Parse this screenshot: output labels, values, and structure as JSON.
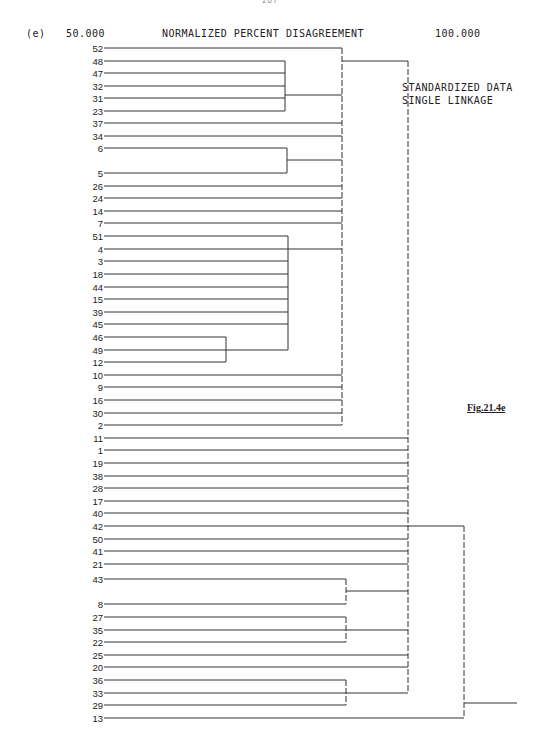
{
  "header": {
    "page_number": "267",
    "panel_label": "(e)",
    "axis_min": "50.000",
    "axis_title": "NORMALIZED PERCENT DISAGREEMENT",
    "axis_max": "100.000"
  },
  "annotations": {
    "line1": "STANDARDIZED DATA",
    "line2": "SINGLE LINKAGE",
    "figure_caption": "Fig.21.4e"
  },
  "chart_data": {
    "type": "dendrogram",
    "title": "NORMALIZED PERCENT DISAGREEMENT",
    "xlabel": "Normalized percent disagreement",
    "x_range": [
      50.0,
      100.0
    ],
    "method": "Single linkage, standardized data",
    "leaf_order": [
      52,
      48,
      47,
      32,
      31,
      23,
      37,
      34,
      6,
      5,
      26,
      24,
      14,
      7,
      51,
      4,
      3,
      18,
      44,
      15,
      39,
      45,
      46,
      49,
      12,
      10,
      9,
      16,
      30,
      2,
      11,
      1,
      19,
      38,
      28,
      17,
      40,
      42,
      50,
      41,
      21,
      43,
      8,
      27,
      35,
      22,
      25,
      20,
      36,
      33,
      29,
      13
    ],
    "leaf_y": {
      "52": 48,
      "48": 61,
      "47": 73,
      "32": 86,
      "31": 98,
      "23": 111,
      "37": 123,
      "34": 136,
      "6": 148,
      "5": 173,
      "26": 186,
      "24": 198,
      "14": 211,
      "7": 223,
      "51": 236,
      "4": 249,
      "3": 261,
      "18": 274,
      "44": 287,
      "15": 299,
      "39": 312,
      "45": 324,
      "46": 337,
      "49": 350,
      "12": 362,
      "10": 375,
      "9": 387,
      "16": 400,
      "30": 413,
      "2": 425,
      "11": 438,
      "1": 450,
      "19": 463,
      "38": 476,
      "28": 488,
      "17": 501,
      "40": 513,
      "42": 526,
      "50": 539,
      "41": 551,
      "21": 564,
      "43": 579,
      "8": 604,
      "27": 617,
      "35": 630,
      "22": 642,
      "25": 655,
      "20": 667,
      "36": 680,
      "33": 693,
      "29": 705,
      "13": 718
    },
    "leaf_x": 104,
    "merges": [
      {
        "members": [
          48,
          47,
          32,
          31,
          23
        ],
        "x": 285,
        "connect_y": 95,
        "approx_level": 85.5
      },
      {
        "members": [
          6,
          5
        ],
        "x": 287,
        "connect_y": 160,
        "approx_level": 85.7
      },
      {
        "members": [
          46,
          49,
          12
        ],
        "x": 226,
        "connect_y": 350,
        "approx_level": 80.5
      },
      {
        "members": [
          51,
          4,
          3,
          18,
          44,
          15,
          39,
          45,
          "46-49-12"
        ],
        "x": 288,
        "connect_y": 249,
        "approx_level": 85.8
      },
      {
        "members": [
          52,
          "48-23",
          37,
          34,
          "6-5",
          26,
          24,
          14,
          7,
          "51-12",
          10,
          9,
          16,
          30,
          2
        ],
        "x": 342,
        "connect_y": 61,
        "approx_level": 90.5
      },
      {
        "members": [
          43,
          8
        ],
        "x": 346,
        "connect_y": 591,
        "approx_level": 90.8
      },
      {
        "members": [
          27,
          35,
          22
        ],
        "x": 346,
        "connect_y": 630,
        "approx_level": 90.8
      },
      {
        "members": [
          36,
          33,
          29
        ],
        "x": 346,
        "connect_y": 693,
        "approx_level": 90.8
      },
      {
        "members": [
          "52-2",
          11,
          1,
          19,
          38,
          28,
          17,
          40,
          42,
          50,
          41,
          21,
          "43-8",
          "27-22",
          25,
          20,
          "36-29"
        ],
        "x": 408,
        "connect_y": 526,
        "approx_level": 96.0
      },
      {
        "members": [
          "all-others",
          13
        ],
        "x": 464,
        "connect_y": 703,
        "approx_level": 100.0
      }
    ]
  }
}
